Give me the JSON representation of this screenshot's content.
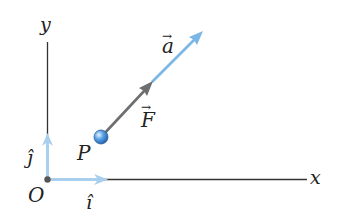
{
  "diagram": {
    "title": "",
    "axes": {
      "x_label": "x",
      "y_label": "y",
      "origin_label": "O"
    },
    "unit_vectors": {
      "i_label": "î",
      "j_label": "ĵ"
    },
    "point": {
      "label": "P"
    },
    "vectors": {
      "force_label": "F",
      "accel_label": "a",
      "arrow_mark": "→"
    },
    "colors": {
      "axis": "#333333",
      "unit_vector": "#9fcbeb",
      "force": "#6d6e70",
      "acceleration": "#7bb7e6",
      "particle": "#3f88d6",
      "origin_dot": "#555555"
    }
  }
}
